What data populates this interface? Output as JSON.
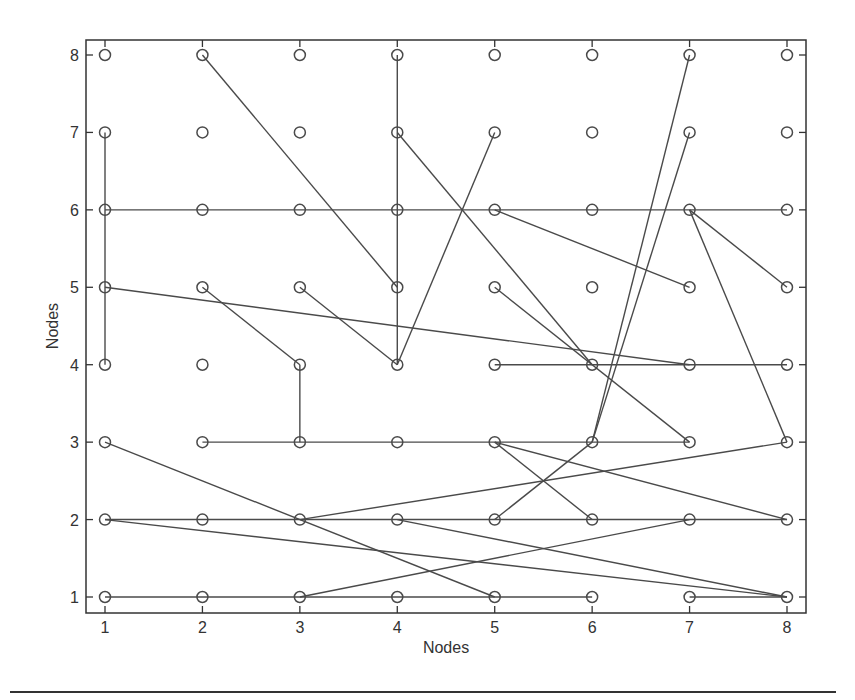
{
  "chart_data": {
    "type": "network-grid",
    "title": "",
    "xlabel": "Nodes",
    "ylabel": "Nodes",
    "xlim": [
      0.8,
      8.2
    ],
    "ylim": [
      0.8,
      8.2
    ],
    "x_ticks": [
      1,
      2,
      3,
      4,
      5,
      6,
      7,
      8
    ],
    "y_ticks": [
      1,
      2,
      3,
      4,
      5,
      6,
      7,
      8
    ],
    "grid": false,
    "nodes": "all integer (x,y) pairs for x in 1..8, y in 1..8, drawn as open circles",
    "edges": [
      [
        [
          1,
          7
        ],
        [
          1,
          4
        ]
      ],
      [
        [
          1,
          6
        ],
        [
          8,
          6
        ]
      ],
      [
        [
          1,
          5
        ],
        [
          7,
          4
        ]
      ],
      [
        [
          2,
          8
        ],
        [
          4,
          5
        ]
      ],
      [
        [
          2,
          5
        ],
        [
          3,
          4
        ]
      ],
      [
        [
          3,
          5
        ],
        [
          4,
          4
        ]
      ],
      [
        [
          3,
          4
        ],
        [
          3,
          3
        ]
      ],
      [
        [
          4,
          8
        ],
        [
          4,
          4
        ]
      ],
      [
        [
          4,
          4
        ],
        [
          5,
          7
        ]
      ],
      [
        [
          4,
          7
        ],
        [
          6,
          4
        ]
      ],
      [
        [
          5,
          5
        ],
        [
          7,
          3
        ]
      ],
      [
        [
          5,
          6
        ],
        [
          7,
          5
        ]
      ],
      [
        [
          7,
          6
        ],
        [
          8,
          5
        ]
      ],
      [
        [
          7,
          6
        ],
        [
          8,
          3
        ]
      ],
      [
        [
          5,
          4
        ],
        [
          8,
          4
        ]
      ],
      [
        [
          6,
          3
        ],
        [
          7,
          8
        ]
      ],
      [
        [
          6,
          3
        ],
        [
          7,
          7
        ]
      ],
      [
        [
          2,
          3
        ],
        [
          7,
          3
        ]
      ],
      [
        [
          5,
          3
        ],
        [
          8,
          2
        ]
      ],
      [
        [
          5,
          3
        ],
        [
          6,
          2
        ]
      ],
      [
        [
          5,
          2
        ],
        [
          6,
          3
        ]
      ],
      [
        [
          3,
          2
        ],
        [
          8,
          3
        ]
      ],
      [
        [
          1,
          2
        ],
        [
          8,
          2
        ]
      ],
      [
        [
          1,
          2
        ],
        [
          8,
          1
        ]
      ],
      [
        [
          1,
          3
        ],
        [
          5,
          1
        ]
      ],
      [
        [
          4,
          2
        ],
        [
          8,
          1
        ]
      ],
      [
        [
          3,
          1
        ],
        [
          7,
          2
        ]
      ],
      [
        [
          1,
          1
        ],
        [
          6,
          1
        ]
      ],
      [
        [
          7,
          1
        ],
        [
          8,
          1
        ]
      ]
    ]
  },
  "axes": {
    "x_label": "Nodes",
    "y_label": "Nodes",
    "x_tick_labels": [
      "1",
      "2",
      "3",
      "4",
      "5",
      "6",
      "7",
      "8"
    ],
    "y_tick_labels": [
      "1",
      "2",
      "3",
      "4",
      "5",
      "6",
      "7",
      "8"
    ]
  },
  "style": {
    "line_color": "#4a4a4a",
    "axis_color": "#333333"
  }
}
